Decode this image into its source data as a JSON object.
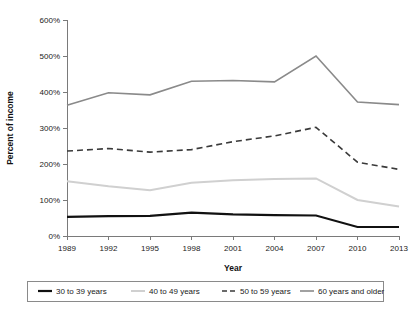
{
  "chart_data": {
    "type": "line",
    "title": "",
    "xlabel": "Year",
    "ylabel": "Percent of income",
    "categories": [
      "1989",
      "1992",
      "1995",
      "1998",
      "2001",
      "2004",
      "2007",
      "2010",
      "2013"
    ],
    "ylim": [
      0,
      600
    ],
    "yticks": [
      0,
      100,
      200,
      300,
      400,
      500,
      600
    ],
    "ytick_labels": [
      "0%",
      "100%",
      "200%",
      "300%",
      "400%",
      "500%",
      "600%"
    ],
    "grid": false,
    "legend_position": "bottom",
    "series": [
      {
        "name": "30 to 39 years",
        "color": "#111111",
        "width": 2.2,
        "dash": "none",
        "values": [
          53,
          55,
          56,
          65,
          60,
          58,
          57,
          25,
          25
        ]
      },
      {
        "name": "40 to 49 years",
        "color": "#d0d0d0",
        "width": 2.0,
        "dash": "none",
        "values": [
          152,
          138,
          127,
          148,
          155,
          158,
          160,
          100,
          82
        ]
      },
      {
        "name": "50 to 59 years",
        "color": "#3a3a3a",
        "width": 1.6,
        "dash": "6,4",
        "values": [
          236,
          243,
          233,
          240,
          262,
          278,
          302,
          205,
          185
        ]
      },
      {
        "name": "60 years and older",
        "color": "#8a8a8a",
        "width": 1.6,
        "dash": "none",
        "values": [
          363,
          398,
          392,
          430,
          432,
          428,
          500,
          372,
          365
        ]
      }
    ]
  },
  "legend": {
    "items": [
      {
        "label": "30 to 39 years"
      },
      {
        "label": "40 to 49 years"
      },
      {
        "label": "50 to 59 years"
      },
      {
        "label": "60 years and older"
      }
    ]
  }
}
